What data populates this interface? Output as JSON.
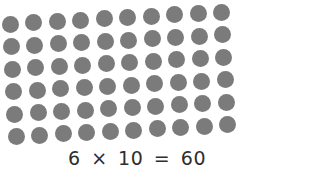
{
  "array": {
    "rows": 6,
    "columns": 10,
    "dot_color": "#7b7b7b",
    "dot_diameter": 17,
    "origin": {
      "x": 10,
      "y": 24
    },
    "col_step": {
      "dx": 23.5,
      "dy": -1.3
    },
    "row_step": {
      "dx": 1.2,
      "dy": 22.5
    }
  },
  "equation": {
    "factor_rows": "6",
    "times": "×",
    "factor_columns": "10",
    "equals": "=",
    "product": "60"
  }
}
